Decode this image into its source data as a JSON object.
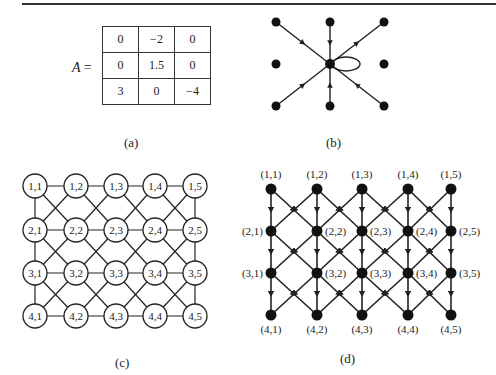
{
  "panel_a": {
    "label": "A",
    "equals": "=",
    "matrix": [
      [
        "0",
        "−2",
        "0"
      ],
      [
        "0",
        "1.5",
        "0"
      ],
      [
        "3",
        "0",
        "−4"
      ]
    ],
    "caption": "(a)"
  },
  "panel_b": {
    "caption": "(b)",
    "description": "3x3 stencil graph: center node with directed edges to/from 6 neighbors and a self-loop"
  },
  "panel_c": {
    "caption": "(c)",
    "rows": 4,
    "cols": 5,
    "node_labels": [
      [
        "1,1",
        "1,2",
        "1,3",
        "1,4",
        "1,5"
      ],
      [
        "2,1",
        "2,2",
        "2,3",
        "2,4",
        "2,5"
      ],
      [
        "3,1",
        "3,2",
        "3,3",
        "3,4",
        "3,5"
      ],
      [
        "4,1",
        "4,2",
        "4,3",
        "4,4",
        "4,5"
      ]
    ]
  },
  "panel_d": {
    "caption": "(d)",
    "rows": 4,
    "cols": 5,
    "node_labels": [
      [
        "(1,1)",
        "(1,2)",
        "(1,3)",
        "(1,4)",
        "(1,5)"
      ],
      [
        "(2,1)",
        "(2,2)",
        "(2,3)",
        "(2,4)",
        "(2,5)"
      ],
      [
        "(3,1)",
        "(3,2)",
        "(3,3)",
        "(3,4)",
        "(3,5)"
      ],
      [
        "(4,1)",
        "(4,2)",
        "(4,3)",
        "(4,4)",
        "(4,5)"
      ]
    ]
  }
}
